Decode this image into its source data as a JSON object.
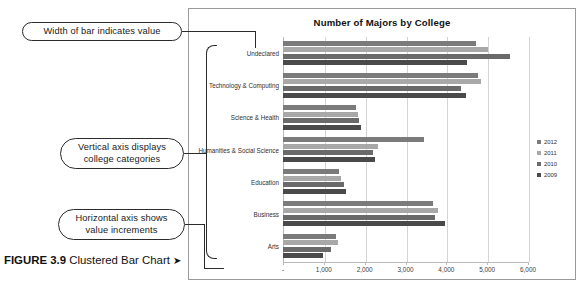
{
  "figure": {
    "number_label": "FIGURE 3.9",
    "caption": " Clustered Bar Chart ",
    "arrow": "➤"
  },
  "annotations": [
    {
      "id": "width-of-bar",
      "text": "Width of bar indicates value"
    },
    {
      "id": "vertical-axis",
      "text": "Vertical axis displays college categories"
    },
    {
      "id": "horizontal-axis",
      "text": "Horizontal axis shows value increments"
    }
  ],
  "chart_data": {
    "type": "bar",
    "orientation": "horizontal",
    "title": "Number of Majors by College",
    "xlabel": "",
    "ylabel": "",
    "grid": true,
    "legend_position": "right",
    "xlim": [
      0,
      6000
    ],
    "xticks": [
      0,
      1000,
      2000,
      3000,
      4000,
      5000,
      6000
    ],
    "xticklabels": [
      "-",
      "1,000",
      "2,000",
      "3,000",
      "4,000",
      "5,000",
      "6,000"
    ],
    "categories": [
      "Undeclared",
      "Technology & Computing",
      "Science & Health",
      "Humanities & Social Science",
      "Education",
      "Business",
      "Arts"
    ],
    "series": [
      {
        "name": "2012",
        "color": "#7b7b7b",
        "values": [
          4720,
          4780,
          1790,
          3450,
          1370,
          3680,
          1310
        ]
      },
      {
        "name": "2011",
        "color": "#a8a8a8",
        "values": [
          5020,
          4850,
          1830,
          2330,
          1420,
          3800,
          1350
        ]
      },
      {
        "name": "2010",
        "color": "#6a6a6a",
        "values": [
          5560,
          4360,
          1850,
          2210,
          1490,
          3720,
          1180
        ]
      },
      {
        "name": "2009",
        "color": "#4a4a4a",
        "values": [
          4510,
          4480,
          1900,
          2260,
          1540,
          3960,
          980
        ]
      }
    ]
  }
}
